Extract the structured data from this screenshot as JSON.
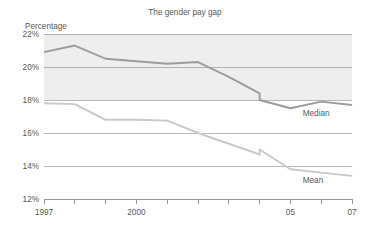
{
  "chart_data": {
    "type": "line",
    "title": "The gender pay gap",
    "xlabel": "",
    "ylabel": "Percentage",
    "ylim": [
      12,
      22
    ],
    "xlim": [
      1997,
      2007
    ],
    "yticks": [
      12,
      14,
      16,
      18,
      20,
      22
    ],
    "ytick_labels": [
      "12%",
      "14%",
      "16%",
      "18%",
      "20%",
      "22%"
    ],
    "xticks": [
      1997,
      1998,
      1999,
      2000,
      2001,
      2002,
      2003,
      2004,
      2005,
      2006,
      2007
    ],
    "xtick_labels": [
      "1997",
      "",
      "",
      "2000",
      "",
      "",
      "",
      "",
      "05",
      "",
      "07"
    ],
    "grid": true,
    "legend_position": "inline-right",
    "shaded_band": {
      "from": 18,
      "to": 22,
      "color": "#eeeeee"
    },
    "x": [
      1997,
      1998,
      1999,
      2000,
      2001,
      2002,
      2003,
      2004,
      2004,
      2005,
      2006,
      2007
    ],
    "series": [
      {
        "name": "Median",
        "color": "#9b9b9d",
        "values": [
          20.9,
          21.3,
          20.5,
          20.35,
          20.2,
          20.3,
          19.4,
          18.4,
          18.0,
          17.5,
          17.9,
          17.7
        ]
      },
      {
        "name": "Mean",
        "color": "#c9c9cb",
        "values": [
          17.8,
          17.75,
          16.8,
          16.8,
          16.75,
          16.0,
          15.35,
          14.7,
          15.0,
          13.8,
          13.6,
          13.4
        ]
      }
    ],
    "annotations": [
      {
        "text": "Median",
        "x": 2005.4,
        "y": 17.05
      },
      {
        "text": "Mean",
        "x": 2005.4,
        "y": 12.95
      }
    ]
  },
  "axis": {
    "ylabel": "Percentage"
  }
}
